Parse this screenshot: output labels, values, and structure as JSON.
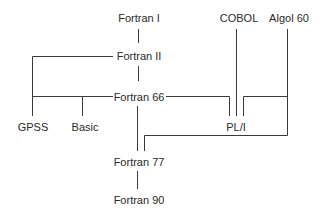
{
  "diagram": {
    "type": "language-genealogy-tree",
    "nodes": {
      "fortran1": {
        "label": "Fortran I",
        "x": 139,
        "y": 18
      },
      "fortran2": {
        "label": "Fortran II",
        "x": 139,
        "y": 56
      },
      "fortran66": {
        "label": "Fortran 66",
        "x": 139,
        "y": 97
      },
      "fortran77": {
        "label": "Fortran 77",
        "x": 139,
        "y": 162
      },
      "fortran90": {
        "label": "Fortran 90",
        "x": 139,
        "y": 200
      },
      "gpss": {
        "label": "GPSS",
        "x": 33,
        "y": 127
      },
      "basic": {
        "label": "Basic",
        "x": 85,
        "y": 127
      },
      "pli": {
        "label": "PL/I",
        "x": 236,
        "y": 127
      },
      "cobol": {
        "label": "COBOL",
        "x": 239,
        "y": 18
      },
      "algol60": {
        "label": "Algol 60",
        "x": 289,
        "y": 18
      }
    },
    "edges": [
      {
        "from": "Fortran I",
        "to": "Fortran II"
      },
      {
        "from": "Fortran II",
        "to": "GPSS"
      },
      {
        "from": "Fortran II",
        "to": "Fortran 66"
      },
      {
        "from": "Fortran 66",
        "to": "Basic"
      },
      {
        "from": "Fortran 66",
        "to": "PL/I"
      },
      {
        "from": "COBOL",
        "to": "PL/I"
      },
      {
        "from": "Algol 60",
        "to": "PL/I"
      },
      {
        "from": "Algol 60",
        "to": "Fortran 77"
      },
      {
        "from": "Fortran 66",
        "to": "Fortran 77"
      },
      {
        "from": "Fortran 77",
        "to": "Fortran 90"
      }
    ],
    "colors": {
      "line": "#3a3a3a",
      "text": "#2a2a2a",
      "background": "#ffffff"
    }
  }
}
